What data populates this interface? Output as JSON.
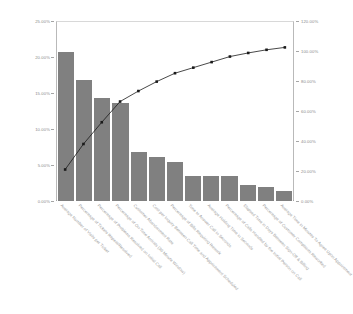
{
  "chart_data": {
    "type": "bar",
    "title": "",
    "subtitle": "",
    "xlabel": "",
    "ylabel": "",
    "y2label": "",
    "grid": false,
    "legend": "none",
    "ylim": [
      0,
      25
    ],
    "y2lim": [
      0,
      120
    ],
    "yticks": [
      "0.00%",
      "5.00%",
      "10.00%",
      "15.00%",
      "20.00%",
      "25.00%"
    ],
    "ytick_values": [
      0,
      5,
      10,
      15,
      20,
      25
    ],
    "y2ticks": [
      "0.00%",
      "20.00%",
      "40.00%",
      "60.00%",
      "80.00%",
      "100.00%",
      "120.00%"
    ],
    "y2tick_values": [
      0,
      20,
      40,
      60,
      80,
      100,
      120
    ],
    "categories": [
      "Average Number of Visits per Ticket",
      "Percentage of Tickets Repeat/Resolved",
      "Percentage of Problems Resolved on Initial Call",
      "Percentage of On-Time Arrivals (30 Minute Window)",
      "Customer Abandonment Rate",
      "Cost per Inquiry Between Call Time and Appointment Scheduled",
      "Percentage of Bills Requiring Rework",
      "Time to Answer Call in Seconds",
      "Average Holding Time in Seconds",
      "Percentage of Calls Handled by the Initial Person on Call",
      "Elapsed Time in Days Between Sign-Off & Billing",
      "Percentage of Customer Complaints Reworked",
      "Average Time in Minutes To Agree Upon Appointment"
    ],
    "series": [
      {
        "name": "Percent of Total",
        "type": "bar",
        "axis": "left",
        "color": "#808080",
        "values": [
          21.0,
          17.0,
          14.5,
          13.8,
          7.0,
          6.3,
          5.6,
          3.7,
          3.7,
          3.7,
          2.4,
          2.1,
          1.6
        ]
      },
      {
        "name": "Cumulative Percentage",
        "type": "line",
        "axis": "right",
        "color": "#1a1a1a",
        "values": [
          21.0,
          38.0,
          52.5,
          66.3,
          73.3,
          79.6,
          85.2,
          88.9,
          92.6,
          96.3,
          98.7,
          100.8,
          102.4
        ]
      }
    ]
  }
}
